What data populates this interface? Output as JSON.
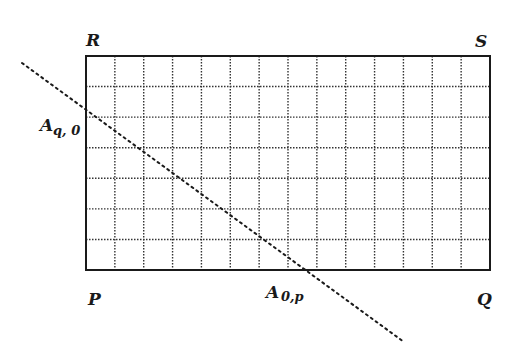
{
  "diagram": {
    "rect": {
      "x": 86,
      "y": 56,
      "width": 404,
      "height": 214,
      "cols": 14,
      "rows": 7
    },
    "stroke_color": "#1a1a1a",
    "grid_color": "#333333",
    "corner_labels": {
      "top_left": "R",
      "top_right": "S",
      "bottom_left": "P",
      "bottom_right": "Q"
    },
    "point_labels": {
      "left_edge": {
        "main": "A",
        "sub": "q, 0"
      },
      "bottom_edge": {
        "main": "A",
        "sub": "0,p"
      }
    },
    "diagonal": {
      "x1": 22,
      "y1": 63,
      "x2": 404,
      "y2": 342,
      "style": "dotted"
    }
  }
}
